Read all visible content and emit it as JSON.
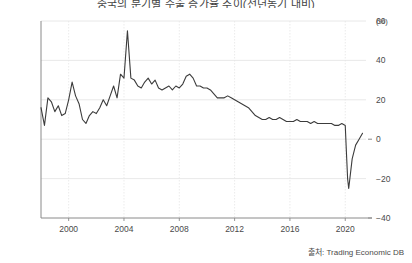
{
  "chart_data": {
    "type": "line",
    "title": "중국의 분기별 수출 증가율 추이(전년동기 대비)",
    "subtitle": "",
    "xlabel": "",
    "ylabel": "",
    "unit_label": "(%)",
    "xlim": [
      1998.0,
      2021.5
    ],
    "ylim": [
      -40,
      60
    ],
    "yticks": [
      -40,
      -20,
      0,
      20,
      40,
      60
    ],
    "ytick_labels": [
      "−40",
      "−20",
      "0",
      "20",
      "40",
      "60"
    ],
    "xticks": [
      2000,
      2004,
      2008,
      2012,
      2016,
      2020
    ],
    "xtick_labels": [
      "2000",
      "2004",
      "2008",
      "2012",
      "2016",
      "2020"
    ],
    "grid": true,
    "grid_axis": "both",
    "legend": false,
    "legend_position": "none",
    "line_color": "#3c3c3c",
    "line_width": 1.1,
    "series": [
      {
        "name": "수출 증가율",
        "x": [
          1998.0,
          1998.25,
          1998.5,
          1998.75,
          1999.0,
          1999.25,
          1999.5,
          1999.75,
          2000.0,
          2000.25,
          2000.5,
          2000.75,
          2001.0,
          2001.25,
          2001.5,
          2001.75,
          2002.0,
          2002.25,
          2002.5,
          2002.75,
          2003.0,
          2003.25,
          2003.5,
          2003.75,
          2004.0,
          2004.25,
          2004.5,
          2004.75,
          2005.0,
          2005.25,
          2005.5,
          2005.75,
          2006.0,
          2006.25,
          2006.5,
          2006.75,
          2007.0,
          2007.25,
          2007.5,
          2007.75,
          2008.0,
          2008.25,
          2008.5,
          2008.75,
          2009.0,
          2009.25,
          2009.5,
          2009.75,
          2010.0,
          2010.25,
          2010.5,
          2010.75,
          2011.0,
          2011.25,
          2011.5,
          2011.75,
          2012.0,
          2012.25,
          2012.5,
          2012.75,
          2013.0,
          2013.25,
          2013.5,
          2013.75,
          2014.0,
          2014.25,
          2014.5,
          2014.75,
          2015.0,
          2015.25,
          2015.5,
          2015.75,
          2016.0,
          2016.25,
          2016.5,
          2016.75,
          2017.0,
          2017.25,
          2017.5,
          2017.75,
          2018.0,
          2018.25,
          2018.5,
          2018.75,
          2019.0,
          2019.25,
          2019.5,
          2019.75,
          2020.0,
          2020.08,
          2020.17,
          2020.25,
          2020.5,
          2020.75,
          2021.0,
          2021.25
        ],
        "values": [
          16,
          7,
          21,
          19,
          14,
          17,
          12,
          13,
          20,
          29,
          22,
          18,
          10,
          8,
          12,
          14,
          13,
          16,
          20,
          17,
          22,
          27,
          21,
          33,
          31,
          55,
          31,
          30,
          27,
          26,
          29,
          31,
          28,
          30,
          26,
          25,
          26,
          27,
          25,
          27,
          26,
          28,
          32,
          33,
          31,
          27,
          27,
          26,
          26,
          25,
          23,
          21,
          21,
          21,
          22,
          21,
          20,
          19,
          18,
          17,
          16,
          14,
          12,
          11,
          10,
          10,
          11,
          10,
          10,
          11,
          10,
          9,
          9,
          9,
          10,
          9,
          9,
          9,
          8,
          9,
          8,
          8,
          8,
          8,
          8,
          7,
          7,
          8,
          7,
          -6,
          -20,
          -25,
          -10,
          -3,
          0,
          3
        ]
      }
    ],
    "annotations": [
      {
        "label": "2004 spike peak",
        "x": 2004.25,
        "y": 55
      },
      {
        "label": "COVID-19 trough",
        "x": 2020.25,
        "y": -25
      }
    ]
  },
  "source": {
    "text": "출처: Trading Economic DB"
  }
}
